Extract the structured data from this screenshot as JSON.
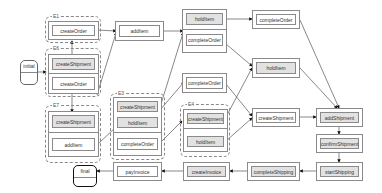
{
  "diagram": {
    "initial": "initial",
    "final": "final",
    "groups": [
      {
        "id": "E1",
        "label": "E1"
      },
      {
        "id": "E6",
        "label": "E6"
      },
      {
        "id": "E7",
        "label": "E7"
      },
      {
        "id": "E3",
        "label": "E3"
      },
      {
        "id": "E4",
        "label": "E4"
      }
    ],
    "nodes": {
      "e1_createOrder": "createOrder",
      "e6_createShipment": "createShipment",
      "e6_createOrder": "createOrder",
      "e7_createShipment": "createShipment",
      "e7_addItem": "addItem",
      "addItem": "addItem",
      "e3_createShipment": "createShipment",
      "e3_holdItem": "holdItem",
      "e3_completeOrder": "completeOrder",
      "combo_holdItem": "holdItem",
      "combo_completeOrder": "completeOrder",
      "completeOrder_mid": "completeOrder",
      "e4_createShipment": "createShipment",
      "e4_holdItem": "holdItem",
      "completeOrder_top": "completeOrder",
      "holdItem_right": "holdItem",
      "createShipment_right": "createShipment",
      "addShipment": "addShipment",
      "confirmShipment": "confirmShipment",
      "startShipping": "startShipping",
      "completeShipping": "completeShipping",
      "createInvoice": "createInvoice",
      "payInvoice": "payInvoice"
    }
  }
}
